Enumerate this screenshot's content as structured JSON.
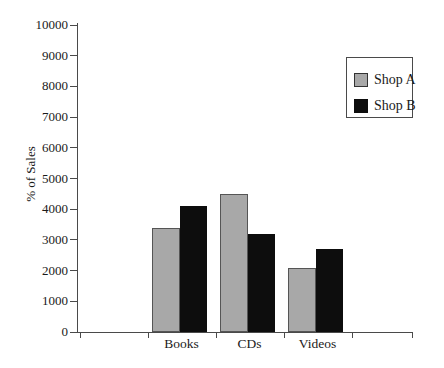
{
  "chart_data": {
    "type": "bar",
    "title": "",
    "xlabel": "",
    "ylabel": "% of Sales",
    "categories": [
      "Books",
      "CDs",
      "Videos"
    ],
    "series": [
      {
        "name": "Shop A",
        "color": "#a8a8a8",
        "border": "#555555",
        "values": [
          3400,
          4500,
          2100
        ]
      },
      {
        "name": "Shop B",
        "color": "#0d0d0d",
        "border": "#0d0d0d",
        "values": [
          4100,
          3200,
          2700
        ]
      }
    ],
    "ylim": [
      0,
      10000
    ],
    "yticks": [
      0,
      1000,
      2000,
      3000,
      4000,
      5000,
      6000,
      7000,
      8000,
      9000,
      10000
    ],
    "grid": false,
    "legend_position": "upper-right"
  }
}
